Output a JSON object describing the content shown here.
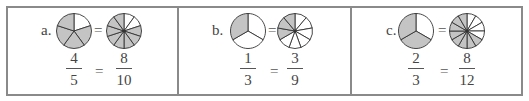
{
  "colors": {
    "border": "#8a8a8a",
    "shaded": "#c4c4c4",
    "unshaded": "#ffffff",
    "stroke": "#333333"
  },
  "panels": [
    {
      "label": "a.",
      "left_pie": {
        "slices": 5,
        "shaded": [
          1,
          2,
          3,
          4
        ]
      },
      "right_pie": {
        "slices": 10,
        "shaded": [
          2,
          3,
          4,
          5,
          6,
          7,
          8,
          9
        ]
      },
      "equals": "=",
      "left_fraction": {
        "numerator": "4",
        "denominator": "5"
      },
      "fraction_equals": "=",
      "right_fraction": {
        "numerator": "8",
        "denominator": "10"
      }
    },
    {
      "label": "b.",
      "left_pie": {
        "slices": 3,
        "shaded": [
          2
        ]
      },
      "right_pie": {
        "slices": 9,
        "shaded": [
          6,
          7,
          8
        ]
      },
      "equals": "=",
      "left_fraction": {
        "numerator": "1",
        "denominator": "3"
      },
      "fraction_equals": "=",
      "right_fraction": {
        "numerator": "3",
        "denominator": "9"
      }
    },
    {
      "label": "c.",
      "left_pie": {
        "slices": 3,
        "shaded": [
          1,
          2
        ]
      },
      "right_pie": {
        "slices": 12,
        "shaded": [
          4,
          5,
          6,
          7,
          8,
          9,
          10,
          11
        ]
      },
      "equals": "=",
      "left_fraction": {
        "numerator": "2",
        "denominator": "3"
      },
      "fraction_equals": "=",
      "right_fraction": {
        "numerator": "8",
        "denominator": "12"
      }
    }
  ]
}
